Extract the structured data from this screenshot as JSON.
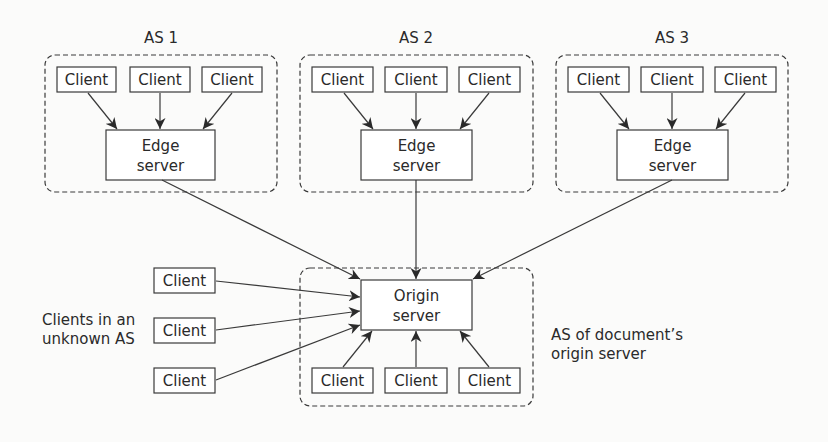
{
  "diagram": {
    "type": "network-topology",
    "colors": {
      "stroke": "#3a3a3a",
      "text": "#2a2a2a",
      "background": "#fbfbfa"
    },
    "autonomous_systems": [
      {
        "id": "as1",
        "label": "AS 1",
        "clients": [
          "Client",
          "Client",
          "Client"
        ],
        "edge_server": {
          "line1": "Edge",
          "line2": "server"
        }
      },
      {
        "id": "as2",
        "label": "AS 2",
        "clients": [
          "Client",
          "Client",
          "Client"
        ],
        "edge_server": {
          "line1": "Edge",
          "line2": "server"
        }
      },
      {
        "id": "as3",
        "label": "AS 3",
        "clients": [
          "Client",
          "Client",
          "Client"
        ],
        "edge_server": {
          "line1": "Edge",
          "line2": "server"
        }
      }
    ],
    "origin_as": {
      "label_line1": "AS of document’s",
      "label_line2": "origin server",
      "origin_server": {
        "line1": "Origin",
        "line2": "server"
      },
      "clients": [
        "Client",
        "Client",
        "Client"
      ]
    },
    "unknown_as": {
      "label_line1": "Clients in an",
      "label_line2": "unknown AS",
      "clients": [
        "Client",
        "Client",
        "Client"
      ]
    },
    "edges": [
      {
        "from": "as1.client1",
        "to": "as1.edge"
      },
      {
        "from": "as1.client2",
        "to": "as1.edge"
      },
      {
        "from": "as1.client3",
        "to": "as1.edge"
      },
      {
        "from": "as2.client1",
        "to": "as2.edge"
      },
      {
        "from": "as2.client2",
        "to": "as2.edge"
      },
      {
        "from": "as2.client3",
        "to": "as2.edge"
      },
      {
        "from": "as3.client1",
        "to": "as3.edge"
      },
      {
        "from": "as3.client2",
        "to": "as3.edge"
      },
      {
        "from": "as3.client3",
        "to": "as3.edge"
      },
      {
        "from": "as1.edge",
        "to": "origin"
      },
      {
        "from": "as2.edge",
        "to": "origin"
      },
      {
        "from": "as3.edge",
        "to": "origin"
      },
      {
        "from": "unknown.client1",
        "to": "origin"
      },
      {
        "from": "unknown.client2",
        "to": "origin"
      },
      {
        "from": "unknown.client3",
        "to": "origin"
      },
      {
        "from": "origin_as.client1",
        "to": "origin"
      },
      {
        "from": "origin_as.client2",
        "to": "origin"
      },
      {
        "from": "origin_as.client3",
        "to": "origin"
      }
    ]
  }
}
